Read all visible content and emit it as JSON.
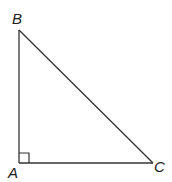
{
  "diagram": {
    "type": "right-triangle",
    "vertices": {
      "A": {
        "label": "A",
        "x": 19,
        "y": 163
      },
      "B": {
        "label": "B",
        "x": 19,
        "y": 30
      },
      "C": {
        "label": "C",
        "x": 153,
        "y": 163
      }
    },
    "right_angle_at": "A",
    "stroke_color": "#333333"
  }
}
